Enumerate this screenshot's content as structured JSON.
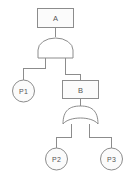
{
  "diagram": {
    "type": "fault-tree",
    "title": "",
    "background_color": "#ffffff",
    "line_color": "#8c8c8c",
    "node_fill_color": "#fbfbfb",
    "text_color": "#555555"
  },
  "nodes": {
    "top_event": {
      "id": "A",
      "label": "A",
      "shape": "rectangle",
      "x": 55,
      "y": 17
    },
    "intermediate_event": {
      "id": "B",
      "label": "B",
      "shape": "rectangle",
      "x": 80,
      "y": 89
    },
    "basic_event_1": {
      "id": "P1",
      "label": "P1",
      "shape": "circle",
      "x": 23,
      "y": 91
    },
    "basic_event_2": {
      "id": "P2",
      "label": "P2",
      "shape": "circle",
      "x": 56,
      "y": 159
    },
    "basic_event_3": {
      "id": "P3",
      "label": "P3",
      "shape": "circle",
      "x": 112,
      "y": 159
    }
  },
  "gates": {
    "and_gate": {
      "id": "G1",
      "type": "AND",
      "parent": "A",
      "children": [
        "P1",
        "B"
      ],
      "x": 55,
      "y": 47
    },
    "or_gate": {
      "id": "G2",
      "type": "OR",
      "parent": "B",
      "children": [
        "P2",
        "P3"
      ],
      "x": 80,
      "y": 117
    }
  },
  "edges": [
    {
      "from": "A",
      "to": "G1"
    },
    {
      "from": "G1",
      "to": "P1"
    },
    {
      "from": "G1",
      "to": "B"
    },
    {
      "from": "B",
      "to": "G2"
    },
    {
      "from": "G2",
      "to": "P2"
    },
    {
      "from": "G2",
      "to": "P3"
    }
  ]
}
